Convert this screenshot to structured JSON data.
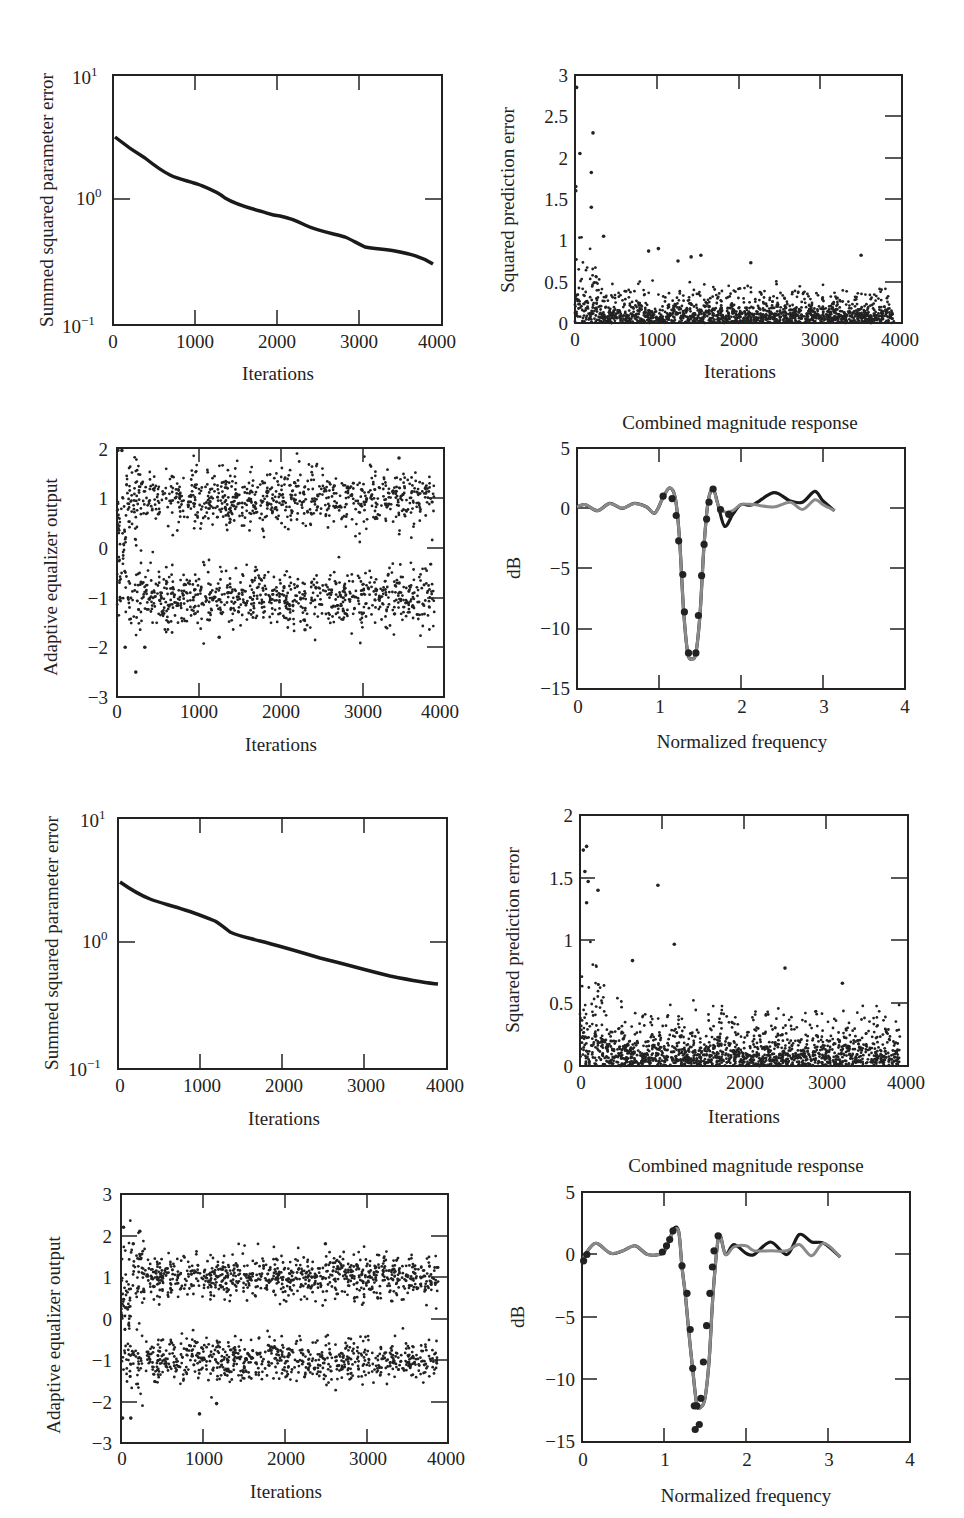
{
  "figure": {
    "panels_layout": "4 rows x 2 columns",
    "colors": {
      "ink": "#1a1a1a",
      "dots": "#222222",
      "gray_curve": "#8a8a8a",
      "dark_curve": "#1a1a1a"
    }
  },
  "chart_data": [
    {
      "id": "p1",
      "type": "line",
      "title": "",
      "xlabel": "Iterations",
      "ylabel": "Summed squared parameter error",
      "yscale": "log",
      "xlim": [
        0,
        4000
      ],
      "ylim": [
        0.1,
        10
      ],
      "xticks": [
        "0",
        "1000",
        "2000",
        "3000",
        "4000"
      ],
      "yticks": [
        "10^1",
        "10^0",
        "10^-1"
      ],
      "x": [
        0,
        200,
        500,
        700,
        900,
        1100,
        1400,
        1700,
        1900,
        2100,
        2400,
        2700,
        2900,
        3100,
        3300,
        3500,
        3700,
        3900
      ],
      "values": [
        3.1,
        2.2,
        1.55,
        1.4,
        1.2,
        1.0,
        0.85,
        0.73,
        0.7,
        0.62,
        0.53,
        0.48,
        0.44,
        0.39,
        0.38,
        0.36,
        0.33,
        0.28
      ],
      "grid": false
    },
    {
      "id": "p2",
      "type": "scatter",
      "title": "",
      "xlabel": "Iterations",
      "ylabel": "Squared prediction error",
      "xlim": [
        0,
        4000
      ],
      "ylim": [
        0,
        3
      ],
      "xticks": [
        "0",
        "1000",
        "2000",
        "3000",
        "4000"
      ],
      "yticks": [
        "0",
        "0.5",
        "1",
        "1.5",
        "2",
        "2.5",
        "3"
      ],
      "description": "Dense cloud near 0–0.3 across all iterations; early outliers up to ~2.85 before 250 iterations; sparse points 0.5–0.9 thereafter",
      "outliers": [
        [
          20,
          2.85
        ],
        [
          60,
          2.05
        ],
        [
          220,
          2.3
        ],
        [
          200,
          1.82
        ],
        [
          200,
          1.4
        ],
        [
          10,
          1.65
        ],
        [
          10,
          1.6
        ],
        [
          350,
          1.05
        ],
        [
          900,
          0.87
        ],
        [
          1020,
          0.9
        ],
        [
          1420,
          0.8
        ],
        [
          1540,
          0.82
        ],
        [
          2150,
          0.73
        ],
        [
          3500,
          0.82
        ],
        [
          1260,
          0.75
        ]
      ],
      "bulk_range": [
        0,
        0.35
      ],
      "n_points": 4000,
      "grid": false
    },
    {
      "id": "p3",
      "type": "scatter",
      "title": "",
      "xlabel": "Iterations",
      "ylabel": "Adaptive equalizer output",
      "xlim": [
        0,
        4000
      ],
      "ylim": [
        -3,
        2
      ],
      "xticks": [
        "0",
        "1000",
        "2000",
        "3000",
        "4000"
      ],
      "yticks": [
        "-3",
        "-2",
        "-1",
        "0",
        "1",
        "2"
      ],
      "description": "Two bands of points centered at +1 and -1 (spread about ±0.5), early transients near 0 and down to -2.5",
      "clusters": [
        {
          "center": 1,
          "spread": 0.45
        },
        {
          "center": -1,
          "spread": 0.45
        }
      ],
      "outliers": [
        [
          60,
          1.95
        ],
        [
          230,
          -2.5
        ],
        [
          100,
          -2.0
        ],
        [
          340,
          -2.0
        ],
        [
          1250,
          -1.8
        ],
        [
          2300,
          -1.65
        ],
        [
          3450,
          1.8
        ]
      ],
      "n_points": 4000,
      "grid": false
    },
    {
      "id": "p4",
      "type": "line",
      "title": "Combined magnitude response",
      "xlabel": "Normalized frequency",
      "ylabel": "dB",
      "xlim": [
        0,
        4
      ],
      "ylim": [
        -15,
        5
      ],
      "xticks": [
        "0",
        "1",
        "2",
        "3",
        "4"
      ],
      "yticks": [
        "-15",
        "-10",
        "-5",
        "0",
        "5"
      ],
      "series": [
        {
          "name": "dark curve",
          "x": [
            0,
            0.1,
            0.25,
            0.4,
            0.55,
            0.7,
            0.85,
            0.95,
            1.05,
            1.13,
            1.2,
            1.25,
            1.3,
            1.35,
            1.4,
            1.45,
            1.5,
            1.55,
            1.6,
            1.66,
            1.72,
            1.8,
            1.9,
            2.0,
            2.15,
            2.4,
            2.6,
            2.75,
            2.9,
            3.0,
            3.14
          ],
          "values": [
            0.1,
            0.3,
            -0.2,
            0.4,
            0.0,
            0.4,
            0.1,
            -0.4,
            0.9,
            1.7,
            0.8,
            -2.5,
            -8.5,
            -12.0,
            -12.5,
            -12.0,
            -8.8,
            -3.0,
            0.6,
            1.6,
            0.3,
            -1.5,
            -0.5,
            0.3,
            0.3,
            1.3,
            0.6,
            0.5,
            1.4,
            0.6,
            -0.2
          ]
        },
        {
          "name": "gray curve",
          "x": [
            0,
            0.1,
            0.25,
            0.4,
            0.55,
            0.7,
            0.85,
            0.95,
            1.05,
            1.13,
            1.2,
            1.25,
            1.3,
            1.35,
            1.4,
            1.45,
            1.5,
            1.55,
            1.6,
            1.66,
            1.72,
            1.8,
            1.9,
            2.0,
            2.15,
            2.4,
            2.6,
            2.75,
            2.9,
            3.0,
            3.14
          ],
          "values": [
            0.1,
            0.3,
            -0.2,
            0.4,
            0.0,
            0.4,
            0.1,
            -0.4,
            0.9,
            1.7,
            0.8,
            -2.5,
            -8.5,
            -12.0,
            -12.5,
            -12.0,
            -8.8,
            -3.0,
            0.6,
            1.6,
            0.3,
            -0.3,
            -0.2,
            0.3,
            0.3,
            0.1,
            0.5,
            -0.1,
            0.7,
            0.3,
            -0.2
          ]
        },
        {
          "name": "markers",
          "x": [
            1.05,
            1.16,
            1.21,
            1.24,
            1.29,
            1.31,
            1.36,
            1.45,
            1.48,
            1.52,
            1.55,
            1.58,
            1.61,
            1.66,
            1.75,
            1.85
          ],
          "values": [
            1.0,
            0.8,
            -0.6,
            -2.7,
            -5.5,
            -8.6,
            -12.0,
            -12.0,
            -8.9,
            -5.6,
            -3.0,
            -0.9,
            0.5,
            1.6,
            -0.1,
            -0.5
          ]
        }
      ],
      "grid": false
    },
    {
      "id": "p5",
      "type": "line",
      "title": "",
      "xlabel": "Iterations",
      "ylabel": "Summed squared parameter error",
      "yscale": "log",
      "xlim": [
        0,
        4000
      ],
      "ylim": [
        0.1,
        10
      ],
      "xticks": [
        "0",
        "1000",
        "2000",
        "3000",
        "4000"
      ],
      "yticks": [
        "10^1",
        "10^0",
        "10^-1"
      ],
      "x": [
        0,
        200,
        400,
        700,
        1000,
        1150,
        1300,
        1600,
        2000,
        2400,
        2800,
        3200,
        3600,
        3900
      ],
      "values": [
        3.0,
        2.4,
        2.0,
        1.7,
        1.4,
        1.25,
        1.08,
        0.98,
        0.83,
        0.7,
        0.6,
        0.51,
        0.45,
        0.42
      ],
      "grid": false
    },
    {
      "id": "p6",
      "type": "scatter",
      "title": "",
      "xlabel": "Iterations",
      "ylabel": "Squared prediction error",
      "xlim": [
        0,
        4000
      ],
      "ylim": [
        0,
        2
      ],
      "xticks": [
        "0",
        "1000",
        "2000",
        "3000",
        "4000"
      ],
      "yticks": [
        "0",
        "0.5",
        "1",
        "1.5",
        "2"
      ],
      "description": "Dense cloud near 0–0.3; early outliers to ~1.75; isolated points at ~1.45 (≈950) and ~0.97 (≈1150)",
      "outliers": [
        [
          40,
          1.72
        ],
        [
          80,
          1.75
        ],
        [
          60,
          1.55
        ],
        [
          100,
          1.47
        ],
        [
          220,
          1.4
        ],
        [
          80,
          1.3
        ],
        [
          950,
          1.44
        ],
        [
          1150,
          0.97
        ],
        [
          640,
          0.84
        ],
        [
          2500,
          0.78
        ],
        [
          3200,
          0.66
        ]
      ],
      "bulk_range": [
        0,
        0.35
      ],
      "n_points": 4000,
      "grid": false
    },
    {
      "id": "p7",
      "type": "scatter",
      "title": "",
      "xlabel": "Iterations",
      "ylabel": "Adaptive equalizer output",
      "xlim": [
        0,
        4000
      ],
      "ylim": [
        -3,
        3
      ],
      "xticks": [
        "0",
        "1000",
        "2000",
        "3000",
        "4000"
      ],
      "yticks": [
        "-3",
        "-2",
        "-1",
        "0",
        "1",
        "2",
        "3"
      ],
      "description": "Two bands of points centered at +1 and -1 (spread about ±0.45); early outliers at ~2.2 and ~-2.4",
      "clusters": [
        {
          "center": 1,
          "spread": 0.4
        },
        {
          "center": -1,
          "spread": 0.4
        }
      ],
      "outliers": [
        [
          30,
          2.2
        ],
        [
          230,
          2.1
        ],
        [
          150,
          1.8
        ],
        [
          120,
          -2.4
        ],
        [
          20,
          -2.4
        ],
        [
          960,
          -2.3
        ],
        [
          1170,
          -2.05
        ],
        [
          2500,
          1.8
        ]
      ],
      "n_points": 4000,
      "grid": false
    },
    {
      "id": "p8",
      "type": "line",
      "title": "Combined magnitude response",
      "xlabel": "Normalized frequency",
      "ylabel": "dB",
      "xlim": [
        0,
        4
      ],
      "ylim": [
        -15,
        5
      ],
      "xticks": [
        "0",
        "1",
        "2",
        "3",
        "4"
      ],
      "yticks": [
        "-15",
        "-10",
        "-5",
        "0",
        "5"
      ],
      "series": [
        {
          "name": "dark curve",
          "x": [
            0,
            0.08,
            0.18,
            0.35,
            0.5,
            0.65,
            0.8,
            0.98,
            1.06,
            1.12,
            1.18,
            1.22,
            1.26,
            1.3,
            1.35,
            1.4,
            1.45,
            1.5,
            1.55,
            1.6,
            1.67,
            1.75,
            1.85,
            2.0,
            2.1,
            2.3,
            2.5,
            2.65,
            2.8,
            2.95,
            3.15
          ],
          "values": [
            -0.5,
            0.4,
            0.9,
            0.1,
            0.3,
            0.7,
            0.0,
            0.1,
            1.0,
            2.1,
            1.8,
            -1.0,
            -3.2,
            -6.0,
            -9.2,
            -12.0,
            -12.2,
            -11.5,
            -8.5,
            -3.0,
            1.5,
            0.0,
            0.8,
            0.1,
            0.0,
            1.0,
            0.0,
            1.6,
            1.0,
            0.9,
            -0.2
          ]
        },
        {
          "name": "gray curve",
          "x": [
            0,
            0.08,
            0.18,
            0.35,
            0.5,
            0.65,
            0.8,
            0.98,
            1.06,
            1.12,
            1.18,
            1.22,
            1.26,
            1.3,
            1.35,
            1.4,
            1.45,
            1.5,
            1.55,
            1.6,
            1.67,
            1.75,
            1.85,
            2.0,
            2.1,
            2.3,
            2.5,
            2.65,
            2.8,
            2.95,
            3.15
          ],
          "values": [
            -0.5,
            0.4,
            0.9,
            0.1,
            0.3,
            0.7,
            0.0,
            0.1,
            1.0,
            1.9,
            1.8,
            -1.0,
            -3.2,
            -6.0,
            -9.2,
            -12.0,
            -12.2,
            -11.5,
            -8.5,
            -3.0,
            1.5,
            0.0,
            0.6,
            0.7,
            0.3,
            0.3,
            0.3,
            0.8,
            -0.1,
            0.9,
            -0.2
          ]
        },
        {
          "name": "markers",
          "x": [
            0.02,
            0.06,
            0.98,
            1.03,
            1.07,
            1.11,
            1.22,
            1.28,
            1.32,
            1.35,
            1.37,
            1.4,
            1.45,
            1.48,
            1.52,
            1.56,
            1.59,
            1.61,
            1.66,
            1.38,
            1.43
          ],
          "values": [
            -0.5,
            0.0,
            0.2,
            0.7,
            1.2,
            1.9,
            -0.9,
            -3.1,
            -6.0,
            -9.1,
            -12.1,
            -12.1,
            -11.5,
            -8.6,
            -5.7,
            -3.1,
            -1.0,
            0.3,
            1.5,
            -14.0,
            -13.6
          ]
        }
      ],
      "grid": false
    }
  ],
  "labels": {
    "p1": {
      "xlabel": "Iterations",
      "ylabel": "Summed squared parameter error",
      "xticks": [
        "0",
        "1000",
        "2000",
        "3000",
        "4000"
      ]
    },
    "p2": {
      "xlabel": "Iterations",
      "ylabel": "Squared prediction error",
      "xticks": [
        "0",
        "1000",
        "2000",
        "3000",
        "4000"
      ],
      "yticks": [
        "0",
        "0.5",
        "1",
        "1.5",
        "2",
        "2.5",
        "3"
      ]
    },
    "p3": {
      "xlabel": "Iterations",
      "ylabel": "Adaptive equalizer output",
      "xticks": [
        "0",
        "1000",
        "2000",
        "3000",
        "4000"
      ],
      "yticks": [
        "−3",
        "−2",
        "−1",
        "0",
        "1",
        "2"
      ]
    },
    "p4": {
      "title": "Combined magnitude response",
      "xlabel": "Normalized frequency",
      "ylabel": "dB",
      "xticks": [
        "0",
        "1",
        "2",
        "3",
        "4"
      ],
      "yticks": [
        "−15",
        "−10",
        "−5",
        "0",
        "5"
      ]
    },
    "p5": {
      "xlabel": "Iterations",
      "ylabel": "Summed squared parameter error",
      "xticks": [
        "0",
        "1000",
        "2000",
        "3000",
        "4000"
      ]
    },
    "p6": {
      "xlabel": "Iterations",
      "ylabel": "Squared prediction error",
      "xticks": [
        "0",
        "1000",
        "2000",
        "3000",
        "4000"
      ],
      "yticks": [
        "0",
        "0.5",
        "1",
        "1.5",
        "2"
      ]
    },
    "p7": {
      "xlabel": "Iterations",
      "ylabel": "Adaptive equalizer output",
      "xticks": [
        "0",
        "1000",
        "2000",
        "3000",
        "4000"
      ],
      "yticks": [
        "−3",
        "−2",
        "−1",
        "0",
        "1",
        "2",
        "3"
      ]
    },
    "p8": {
      "title": "Combined magnitude response",
      "xlabel": "Normalized frequency",
      "ylabel": "dB",
      "xticks": [
        "0",
        "1",
        "2",
        "3",
        "4"
      ],
      "yticks": [
        "−15",
        "−10",
        "−5",
        "0",
        "5"
      ]
    }
  }
}
